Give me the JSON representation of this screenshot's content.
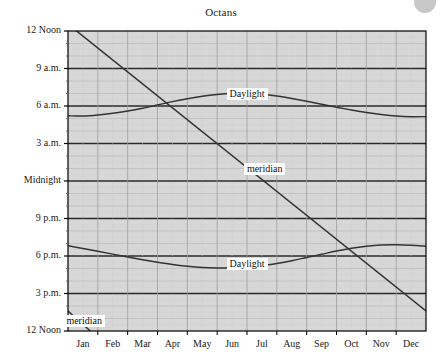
{
  "chart_data": {
    "type": "line",
    "title": "Octans",
    "xlabel": "",
    "ylabel": "",
    "grid": true,
    "legend": "none",
    "background_color": "#d7d7d7",
    "line_color": "#333333",
    "border_color": "#000000",
    "categories": [
      "Jan",
      "Feb",
      "Mar",
      "Apr",
      "May",
      "Jun",
      "Jul",
      "Aug",
      "Sep",
      "Oct",
      "Nov",
      "Dec"
    ],
    "ytick_labels": [
      "12 Noon",
      "9 a.m.",
      "6 a.m.",
      "3 a.m.",
      "Midnight",
      "9 p.m.",
      "6 p.m.",
      "3 p.m.",
      "12 Noon"
    ],
    "ytick_hours": [
      0,
      3,
      6,
      9,
      12,
      15,
      18,
      21,
      24
    ],
    "ylim_hours": [
      0,
      24
    ],
    "y_axis_note": "Hours measured downward from 12 Noon at top to 12 Noon at bottom",
    "annotations": [
      {
        "text": "Daylight",
        "x_month": 6.0,
        "y_hour": 5.05
      },
      {
        "text": "meridian",
        "x_month": 6.6,
        "y_hour": 11.0
      },
      {
        "text": "Daylight",
        "x_month": 6.0,
        "y_hour": 18.6
      },
      {
        "text": "meridian",
        "x_month": 0.55,
        "y_hour": 23.2
      }
    ],
    "series": [
      {
        "name": "sunrise",
        "x": [
          0,
          0.5,
          1,
          1.5,
          2,
          2.5,
          3,
          3.5,
          4,
          4.5,
          5,
          5.5,
          6,
          6.5,
          7,
          7.5,
          8,
          8.5,
          9,
          9.5,
          10,
          10.5,
          11,
          11.5,
          12
        ],
        "values": [
          6.78,
          6.8,
          6.72,
          6.58,
          6.4,
          6.18,
          5.92,
          5.65,
          5.42,
          5.22,
          5.08,
          5.0,
          5.0,
          5.06,
          5.2,
          5.4,
          5.62,
          5.86,
          6.1,
          6.32,
          6.52,
          6.68,
          6.8,
          6.86,
          6.85
        ]
      },
      {
        "name": "sunset",
        "x": [
          0,
          0.5,
          1,
          1.5,
          2,
          2.5,
          3,
          3.5,
          4,
          4.5,
          5,
          5.5,
          6,
          6.5,
          7,
          7.5,
          8,
          8.5,
          9,
          9.5,
          10,
          10.5,
          11,
          11.5,
          12
        ],
        "values": [
          17.18,
          17.4,
          17.62,
          17.85,
          18.08,
          18.3,
          18.5,
          18.68,
          18.82,
          18.92,
          18.96,
          18.96,
          18.9,
          18.78,
          18.6,
          18.38,
          18.12,
          17.86,
          17.6,
          17.38,
          17.22,
          17.12,
          17.1,
          17.14,
          17.22
        ]
      },
      {
        "name": "meridian",
        "segments": [
          {
            "x": [
              0.0,
              12.0
            ],
            "values": [
              -0.55,
              22.4
            ]
          },
          {
            "x": [
              0.0,
              0.75
            ],
            "values": [
              22.4,
              24.0
            ]
          }
        ]
      }
    ]
  }
}
